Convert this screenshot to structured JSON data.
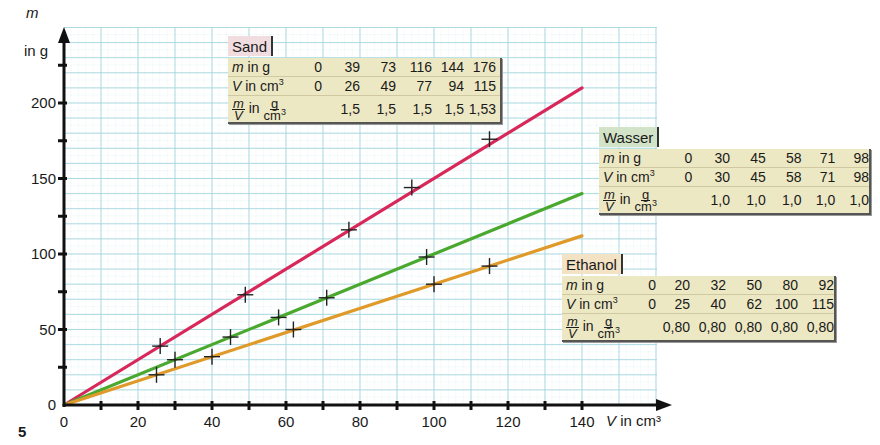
{
  "figure": {
    "number": "5"
  },
  "axes": {
    "ylabel_var": "m",
    "ylabel_unit": "in g",
    "xlabel_var": "V",
    "xlabel_unit": "in cm³",
    "xticks": [
      "0",
      "20",
      "40",
      "60",
      "80",
      "100",
      "120",
      "140"
    ],
    "yticks": [
      "0",
      "50",
      "100",
      "150",
      "200"
    ]
  },
  "colors": {
    "sand": "#d8285a",
    "wasser": "#4aa82e",
    "ethanol": "#e09a2a",
    "grid_major": "#9fd3dc",
    "grid_minor": "#cfe9ee",
    "table_bg": "#ede8c4",
    "sand_title_bg": "#f1dde0",
    "wasser_title_bg": "#d3e3c8",
    "ethanol_title_bg": "#f3e2c4"
  },
  "tables": {
    "sand": {
      "title": "Sand",
      "m_label": "in g",
      "v_label": "in cm",
      "ratio_label": "in",
      "m": [
        "0",
        "39",
        "73",
        "116",
        "144",
        "176"
      ],
      "v": [
        "0",
        "26",
        "49",
        "77",
        "94",
        "115"
      ],
      "ratio": [
        "",
        "1,5",
        "1,5",
        "1,5",
        "1,5",
        "1,53"
      ]
    },
    "wasser": {
      "title": "Wasser",
      "m_label": "in g",
      "v_label": "in cm",
      "ratio_label": "in",
      "m": [
        "0",
        "30",
        "45",
        "58",
        "71",
        "98"
      ],
      "v": [
        "0",
        "30",
        "45",
        "58",
        "71",
        "98"
      ],
      "ratio": [
        "",
        "1,0",
        "1,0",
        "1,0",
        "1,0",
        "1,0"
      ]
    },
    "ethanol": {
      "title": "Ethanol",
      "m_label": "in g",
      "v_label": "in cm",
      "ratio_label": "in",
      "m": [
        "0",
        "20",
        "32",
        "50",
        "80",
        "92"
      ],
      "v": [
        "0",
        "25",
        "40",
        "62",
        "100",
        "115"
      ],
      "ratio": [
        "",
        "0,80",
        "0,80",
        "0,80",
        "0,80",
        "0,80"
      ]
    }
  },
  "chart_data": {
    "type": "scatter",
    "title": "",
    "xlabel": "V in cm³",
    "ylabel": "m in g",
    "xlim": [
      0,
      140
    ],
    "ylim": [
      0,
      200
    ],
    "grid": true,
    "legend_position": "inline tables",
    "series": [
      {
        "name": "Sand",
        "color": "#d8285a",
        "x": [
          0,
          26,
          49,
          77,
          94,
          115
        ],
        "y": [
          0,
          39,
          73,
          116,
          144,
          176
        ],
        "fit_line": {
          "slope": 1.5,
          "x_end": 140,
          "y_end": 210
        }
      },
      {
        "name": "Wasser",
        "color": "#4aa82e",
        "x": [
          0,
          30,
          45,
          58,
          71,
          98
        ],
        "y": [
          0,
          30,
          45,
          58,
          71,
          98
        ],
        "fit_line": {
          "slope": 1.0,
          "x_end": 140,
          "y_end": 140
        }
      },
      {
        "name": "Ethanol",
        "color": "#e09a2a",
        "x": [
          0,
          25,
          40,
          62,
          100,
          115
        ],
        "y": [
          0,
          20,
          32,
          50,
          80,
          92
        ],
        "fit_line": {
          "slope": 0.8,
          "x_end": 140,
          "y_end": 112
        }
      }
    ]
  }
}
